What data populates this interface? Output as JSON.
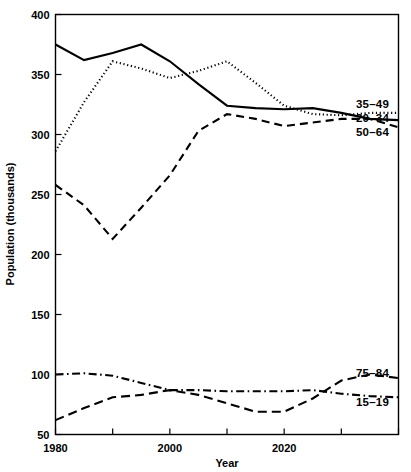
{
  "chart_data": {
    "type": "line",
    "title": "",
    "xlabel": "Year",
    "ylabel": "Population (thousands)",
    "xlim": [
      1980,
      2040
    ],
    "ylim": [
      50,
      400
    ],
    "grid": false,
    "legend_position": "right-inline",
    "y_ticks": [
      50,
      100,
      150,
      200,
      250,
      300,
      350,
      400
    ],
    "y_tick_labels": [
      "50",
      "100",
      "150",
      "200",
      "250",
      "300",
      "350",
      "400"
    ],
    "x_ticks": [
      1980,
      1990,
      2000,
      2010,
      2020,
      2030,
      2040
    ],
    "x_tick_labels": [
      "1980",
      "",
      "2000",
      "",
      "2020",
      "",
      ""
    ],
    "x": [
      1980,
      1985,
      1990,
      1995,
      2000,
      2005,
      2010,
      2015,
      2020,
      2025,
      2030,
      2035,
      2040
    ],
    "series": [
      {
        "name": "35–49",
        "style": "solid",
        "label": "35–49",
        "values": [
          375,
          362,
          368,
          375,
          361,
          342,
          324,
          322,
          321,
          322,
          318,
          313,
          312
        ]
      },
      {
        "name": "20–34",
        "style": "dotted",
        "label": "20–34",
        "values": [
          286,
          327,
          361,
          355,
          347,
          353,
          361,
          343,
          324,
          317,
          316,
          318,
          318
        ]
      },
      {
        "name": "50–64",
        "style": "dashed",
        "label": "50–64",
        "values": [
          258,
          241,
          213,
          239,
          266,
          303,
          317,
          313,
          307,
          310,
          313,
          313,
          306
        ]
      },
      {
        "name": "75–84",
        "style": "longdash",
        "label": "75–84",
        "values": [
          62,
          72,
          81,
          83,
          87,
          83,
          76,
          69,
          69,
          80,
          95,
          100,
          97
        ]
      },
      {
        "name": "15–19",
        "style": "dashdot",
        "label": "15–19",
        "values": [
          100,
          101,
          99,
          93,
          87,
          87,
          86,
          86,
          86,
          87,
          84,
          82,
          81
        ]
      }
    ]
  },
  "axis": {
    "y_label": "Population (thousands)",
    "x_label": "Year"
  },
  "legend": {
    "upper": [
      "35–49",
      "20–34",
      "50–64"
    ],
    "lower": [
      "75–84",
      "15–19"
    ]
  },
  "colors": {
    "foreground": "#000000",
    "background": "#ffffff"
  }
}
